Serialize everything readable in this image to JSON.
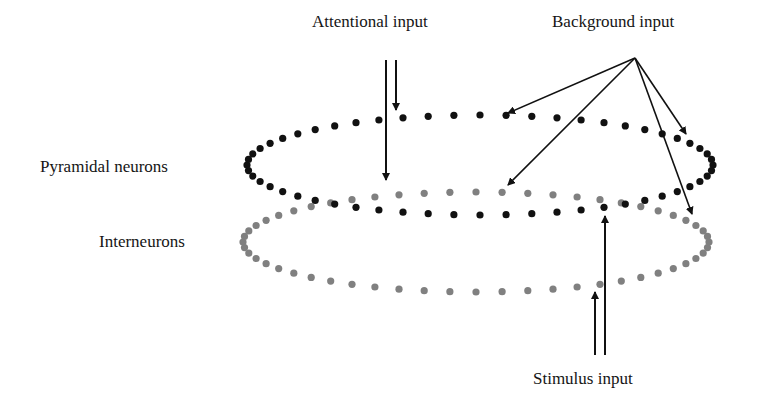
{
  "labels": {
    "attentional": "Attentional input",
    "background": "Background input",
    "pyramidal": "Pyramidal neurons",
    "interneurons": "Interneurons",
    "stimulus": "Stimulus input"
  },
  "colors": {
    "pyramidal_dot": "#111111",
    "interneuron_dot": "#808080",
    "arrow": "#111111",
    "background": "#ffffff"
  },
  "populations": [
    {
      "name": "Pyramidal neurons",
      "shape": "dotted-ellipse",
      "dot_color": "black",
      "cx": 480,
      "cy": 165,
      "rx": 233,
      "ry": 50
    },
    {
      "name": "Interneurons",
      "shape": "dotted-ellipse",
      "dot_color": "gray",
      "cx": 476,
      "cy": 242,
      "rx": 233,
      "ry": 50
    }
  ],
  "inputs": [
    {
      "name": "Attentional input",
      "targets": [
        "Pyramidal neurons",
        "Interneurons"
      ],
      "arrows": 2
    },
    {
      "name": "Background input",
      "targets": [
        "Pyramidal neurons",
        "Interneurons"
      ],
      "arrows": 4
    },
    {
      "name": "Stimulus input",
      "targets": [
        "Pyramidal neurons",
        "Interneurons"
      ],
      "arrows": 2
    }
  ]
}
